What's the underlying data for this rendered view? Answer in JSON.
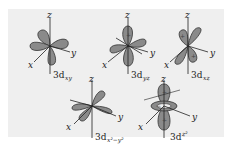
{
  "figure": {
    "colors": {
      "background": "#ffffff",
      "panel": "#efefef",
      "lobe_fill": "#8a8a8a",
      "lobe_stroke": "#333333",
      "axis": "#222222"
    },
    "orbitals": [
      {
        "id": "dxy",
        "name": "3d",
        "subscript": "xy",
        "axes": {
          "z": "z",
          "x": "x",
          "y": "y"
        },
        "signs": [
          "+",
          "+"
        ]
      },
      {
        "id": "dyz",
        "name": "3d",
        "subscript": "yz",
        "axes": {
          "z": "z",
          "x": "x",
          "y": "y"
        },
        "signs": [
          "+",
          "+"
        ]
      },
      {
        "id": "dxz",
        "name": "3d",
        "subscript": "xz",
        "axes": {
          "z": "z",
          "x": "x",
          "y": "y"
        },
        "signs": [
          "+",
          "+"
        ]
      },
      {
        "id": "dx2y2",
        "name": "3d",
        "subscript": "x²−y²",
        "axes": {
          "z": "z",
          "x": "x",
          "y": "y"
        },
        "signs": [
          "+",
          "+"
        ]
      },
      {
        "id": "dz2",
        "name": "3d",
        "subscript": "z²",
        "axes": {
          "z": "z",
          "x": "x",
          "y": "y"
        },
        "signs": [
          "+",
          "−",
          "+"
        ]
      }
    ]
  }
}
